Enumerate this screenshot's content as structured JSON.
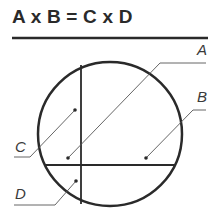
{
  "title": "A x B = C x D",
  "labels": {
    "a": "A",
    "b": "B",
    "c": "C",
    "d": "D"
  },
  "colors": {
    "ink": "#2a2a2a",
    "leader": "#555555",
    "background": "#ffffff"
  }
}
